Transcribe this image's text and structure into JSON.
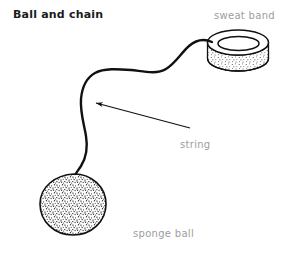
{
  "figure": {
    "title": "Ball and chain",
    "background_color": "#ffffff",
    "ink_color": "#111111",
    "label_color": "#9d9d9d",
    "width": 287,
    "height": 259
  },
  "labels": {
    "sweat_band": "sweat band",
    "string": "string",
    "sponge_ball": "sponge ball"
  },
  "parts": [
    {
      "name": "sweat-band",
      "label": "sweat band",
      "shape": "ring-cylinder",
      "texture": "stipple-light"
    },
    {
      "name": "string",
      "label": "string",
      "shape": "curved-line",
      "texture": "none"
    },
    {
      "name": "sponge-ball",
      "label": "sponge ball",
      "shape": "rounded-blob",
      "texture": "stipple-dense"
    }
  ],
  "annotation_arrow": {
    "name": "string-pointer-arrow",
    "points_from": "string",
    "points_to": "string-curve"
  }
}
